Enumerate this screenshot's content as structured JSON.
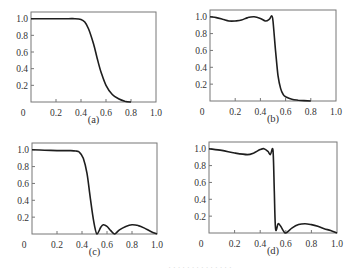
{
  "chart_data": [
    {
      "id": "a",
      "type": "line",
      "caption": "(a)",
      "xlim": [
        0,
        1.0
      ],
      "ylim": [
        0,
        1.08
      ],
      "xticks": [
        "0",
        "0.2",
        "0.4",
        "0.6",
        "0.8",
        "1.0"
      ],
      "yticks": [
        "0.2",
        "0.4",
        "0.6",
        "0.8",
        "1.0"
      ],
      "grid": false,
      "x": [
        0,
        0.1,
        0.2,
        0.3,
        0.35,
        0.4,
        0.43,
        0.46,
        0.5,
        0.53,
        0.56,
        0.6,
        0.65,
        0.7,
        0.75,
        0.8
      ],
      "values": [
        1.0,
        1.0,
        1.0,
        1.0,
        1.0,
        0.99,
        0.96,
        0.88,
        0.7,
        0.52,
        0.36,
        0.2,
        0.09,
        0.04,
        0.01,
        0.0
      ]
    },
    {
      "id": "b",
      "type": "line",
      "caption": "(b)",
      "xlim": [
        0,
        1.0
      ],
      "ylim": [
        0,
        1.08
      ],
      "xticks": [
        "0",
        "0.2",
        "0.4",
        "0.6",
        "0.8",
        "1.0"
      ],
      "yticks": [
        "0.2",
        "0.4",
        "0.6",
        "0.8",
        "1.0"
      ],
      "grid": false,
      "x": [
        0,
        0.05,
        0.1,
        0.15,
        0.2,
        0.25,
        0.3,
        0.35,
        0.4,
        0.44,
        0.47,
        0.49,
        0.5,
        0.52,
        0.54,
        0.56,
        0.58,
        0.6,
        0.65,
        0.7,
        0.8
      ],
      "values": [
        1.0,
        0.99,
        0.97,
        0.95,
        0.95,
        0.96,
        0.99,
        1.0,
        0.98,
        0.95,
        0.97,
        1.01,
        0.95,
        0.6,
        0.3,
        0.15,
        0.08,
        0.05,
        0.02,
        0.01,
        0.0
      ]
    },
    {
      "id": "c",
      "type": "line",
      "caption": "(c)",
      "xlim": [
        0,
        1.0
      ],
      "ylim": [
        0,
        1.08
      ],
      "xticks": [
        "0",
        "0.2",
        "0.4",
        "0.6",
        "0.8",
        "1.0"
      ],
      "yticks": [
        "0.2",
        "0.4",
        "0.6",
        "0.8",
        "1.0"
      ],
      "grid": false,
      "x": [
        0,
        0.1,
        0.2,
        0.3,
        0.35,
        0.38,
        0.41,
        0.44,
        0.46,
        0.48,
        0.5,
        0.52,
        0.55,
        0.57,
        0.6,
        0.63,
        0.66,
        0.7,
        0.75,
        0.8,
        0.85,
        0.9,
        0.95,
        1.0
      ],
      "values": [
        1.0,
        0.995,
        0.99,
        0.99,
        0.985,
        0.97,
        0.9,
        0.72,
        0.5,
        0.28,
        0.1,
        0.0,
        0.08,
        0.11,
        0.09,
        0.04,
        0.0,
        0.05,
        0.09,
        0.11,
        0.1,
        0.07,
        0.03,
        0.0
      ]
    },
    {
      "id": "d",
      "type": "line",
      "caption": "(d)",
      "xlim": [
        0,
        1.0
      ],
      "ylim": [
        0,
        1.08
      ],
      "xticks": [
        "0",
        "0.2",
        "0.4",
        "0.6",
        "0.8",
        "1.0"
      ],
      "yticks": [
        "0.2",
        "0.4",
        "0.6",
        "0.8",
        "1.0"
      ],
      "grid": false,
      "x": [
        0,
        0.1,
        0.2,
        0.3,
        0.35,
        0.4,
        0.43,
        0.46,
        0.48,
        0.5,
        0.51,
        0.52,
        0.54,
        0.56,
        0.58,
        0.6,
        0.65,
        0.7,
        0.75,
        0.8,
        0.85,
        0.9,
        0.95,
        1.0
      ],
      "values": [
        1.0,
        0.98,
        0.95,
        0.93,
        0.95,
        0.99,
        1.0,
        0.97,
        0.93,
        0.98,
        0.5,
        0.05,
        0.11,
        0.08,
        0.03,
        0.0,
        0.06,
        0.1,
        0.11,
        0.1,
        0.08,
        0.05,
        0.03,
        0.0
      ]
    }
  ],
  "figure": {
    "captions": [
      "(a)",
      "(b)",
      "(c)",
      "(d)"
    ],
    "footer_caption": "· · ·  ·  · · ·  · · ·  ·  · · ·"
  }
}
